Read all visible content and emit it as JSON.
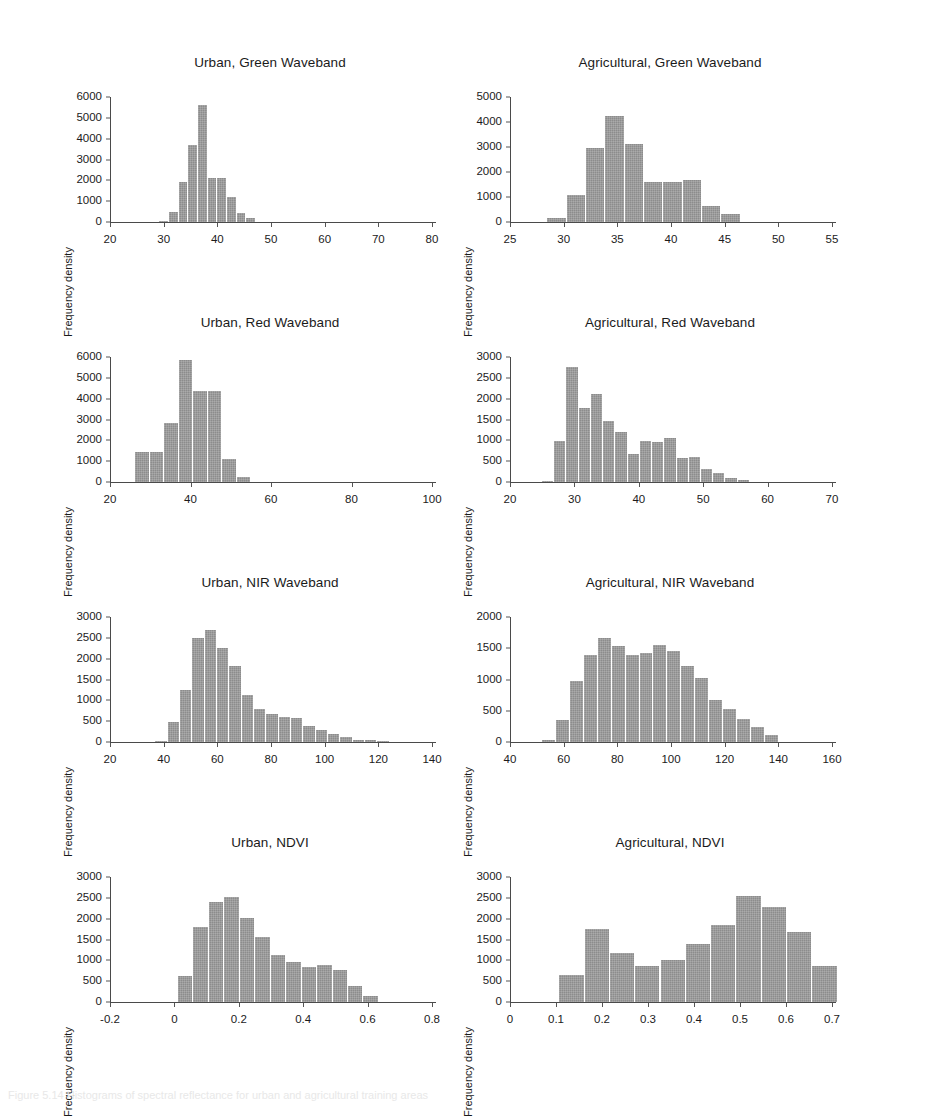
{
  "figure": {
    "background": "#ffffff",
    "bar_color": "#8c8c8c",
    "axis_color": "#4a4a4a",
    "text_color": "#1b1b1b",
    "ylabel": "Frequency density",
    "caption": "Figure 5.14  Histograms of spectral reflectance for urban and agricultural training areas"
  },
  "chart_data": [
    {
      "type": "bar",
      "title": "Urban, Green Waveband",
      "xlabel": "",
      "ylabel": "Frequency density",
      "xlim": [
        20,
        80
      ],
      "ylim": [
        0,
        6000
      ],
      "xticks": [
        20,
        30,
        40,
        50,
        60,
        70,
        80
      ],
      "yticks": [
        0,
        1000,
        2000,
        3000,
        4000,
        5000,
        6000
      ],
      "grid": false,
      "legend": "none",
      "bin_width": 1.8,
      "bin_starts": [
        29.0,
        30.8,
        32.6,
        34.4,
        36.2,
        38.0,
        39.8,
        41.6,
        43.4,
        45.2
      ],
      "values": [
        60,
        500,
        1900,
        3700,
        5600,
        2100,
        2100,
        1200,
        440,
        170
      ]
    },
    {
      "type": "bar",
      "title": "Agricultural, Green Waveband",
      "xlabel": "",
      "ylabel": "Frequency density",
      "xlim": [
        25,
        55
      ],
      "ylim": [
        0,
        5000
      ],
      "xticks": [
        25,
        30,
        35,
        40,
        45,
        50,
        55
      ],
      "yticks": [
        0,
        1000,
        2000,
        3000,
        4000,
        5000
      ],
      "grid": false,
      "legend": "none",
      "bin_width": 1.8,
      "bin_starts": [
        28.4,
        30.2,
        32.0,
        33.8,
        35.6,
        37.4,
        39.2,
        41.0,
        42.8,
        44.6
      ],
      "values": [
        180,
        1100,
        2980,
        4250,
        3110,
        1610,
        1620,
        1690,
        640,
        330
      ]
    },
    {
      "type": "bar",
      "title": "Urban, Red Waveband",
      "xlabel": "",
      "ylabel": "Frequency density",
      "xlim": [
        20,
        100
      ],
      "ylim": [
        0,
        6000
      ],
      "xticks": [
        20,
        40,
        60,
        80,
        100
      ],
      "yticks": [
        0,
        1000,
        2000,
        3000,
        4000,
        5000,
        6000
      ],
      "grid": false,
      "legend": "none",
      "bin_width": 3.6,
      "bin_starts": [
        26.0,
        29.6,
        33.2,
        36.8,
        40.4,
        44.0,
        47.6,
        51.2
      ],
      "values": [
        1430,
        1430,
        2840,
        5880,
        4350,
        4350,
        1120,
        260
      ]
    },
    {
      "type": "bar",
      "title": "Agricultural, Red Waveband",
      "xlabel": "",
      "ylabel": "Frequency density",
      "xlim": [
        20,
        70
      ],
      "ylim": [
        0,
        3000
      ],
      "xticks": [
        20,
        30,
        40,
        50,
        60,
        70
      ],
      "yticks": [
        0,
        500,
        1000,
        1500,
        2000,
        2500,
        3000
      ],
      "grid": false,
      "legend": "none",
      "bin_width": 1.9,
      "bin_starts": [
        24.8,
        26.7,
        28.6,
        30.5,
        32.4,
        34.3,
        36.2,
        38.1,
        40.0,
        41.9,
        43.8,
        45.7,
        47.6,
        49.5,
        51.4,
        53.3,
        55.2
      ],
      "values": [
        20,
        990,
        2750,
        1770,
        2120,
        1470,
        1200,
        670,
        990,
        960,
        1060,
        570,
        610,
        320,
        215,
        105,
        45
      ]
    },
    {
      "type": "bar",
      "title": "Urban, NIR Waveband",
      "xlabel": "",
      "ylabel": "Frequency density",
      "xlim": [
        20,
        140
      ],
      "ylim": [
        0,
        3000
      ],
      "xticks": [
        20,
        40,
        60,
        80,
        100,
        120,
        140
      ],
      "yticks": [
        0,
        500,
        1000,
        1500,
        2000,
        2500,
        3000
      ],
      "grid": false,
      "legend": "none",
      "bin_width": 4.6,
      "bin_starts": [
        36.5,
        41.1,
        45.7,
        50.3,
        54.9,
        59.5,
        64.1,
        68.7,
        73.3,
        77.9,
        82.5,
        87.1,
        91.7,
        96.3,
        100.9,
        105.5,
        110.1,
        114.7,
        119.3
      ],
      "values": [
        35,
        490,
        1250,
        2490,
        2700,
        2250,
        1820,
        1120,
        790,
        680,
        590,
        580,
        380,
        290,
        200,
        110,
        55,
        45,
        30
      ]
    },
    {
      "type": "bar",
      "title": "Agricultural, NIR Waveband",
      "xlabel": "",
      "ylabel": "Frequency density",
      "xlim": [
        40,
        160
      ],
      "ylim": [
        0,
        2000
      ],
      "xticks": [
        40,
        60,
        80,
        100,
        120,
        140,
        160
      ],
      "yticks": [
        0,
        500,
        1000,
        1500,
        2000
      ],
      "grid": false,
      "legend": "none",
      "bin_width": 5.2,
      "bin_starts": [
        51.5,
        56.7,
        61.9,
        67.1,
        72.3,
        77.5,
        82.7,
        87.9,
        93.1,
        98.3,
        103.5,
        108.7,
        113.9,
        119.1,
        124.3,
        129.5,
        134.7
      ],
      "values": [
        25,
        345,
        980,
        1400,
        1660,
        1530,
        1400,
        1420,
        1560,
        1450,
        1220,
        1030,
        670,
        530,
        370,
        240,
        120
      ]
    },
    {
      "type": "bar",
      "title": "Urban, NDVI",
      "xlabel": "",
      "ylabel": "Frequency density",
      "xlim": [
        -0.2,
        0.8
      ],
      "ylim": [
        0,
        3000
      ],
      "xticks": [
        -0.2,
        0.0,
        0.2,
        0.4,
        0.6,
        0.8
      ],
      "yticks": [
        0,
        500,
        1000,
        1500,
        2000,
        2500,
        3000
      ],
      "grid": false,
      "legend": "none",
      "bin_width": 0.048,
      "bin_starts": [
        0.008,
        0.056,
        0.104,
        0.152,
        0.2,
        0.248,
        0.296,
        0.344,
        0.392,
        0.44,
        0.488,
        0.536,
        0.584
      ],
      "values": [
        630,
        1810,
        2400,
        2510,
        2010,
        1550,
        1130,
        960,
        830,
        900,
        775,
        375,
        140
      ]
    },
    {
      "type": "bar",
      "title": "Agricultural, NDVI",
      "xlabel": "",
      "ylabel": "Frequency density",
      "xlim": [
        0.0,
        0.7
      ],
      "ylim": [
        0,
        3000
      ],
      "xticks": [
        0.0,
        0.1,
        0.2,
        0.3,
        0.4,
        0.5,
        0.6,
        0.7
      ],
      "yticks": [
        0,
        500,
        1000,
        1500,
        2000,
        2500,
        3000
      ],
      "grid": false,
      "legend": "none",
      "bin_width": 0.055,
      "bin_starts": [
        0.105,
        0.16,
        0.215,
        0.27,
        0.325,
        0.38,
        0.435,
        0.49,
        0.545,
        0.6,
        0.655
      ],
      "values": [
        645,
        1750,
        1180,
        865,
        1005,
        1385,
        1845,
        2545,
        2280,
        1670,
        865
      ]
    }
  ]
}
